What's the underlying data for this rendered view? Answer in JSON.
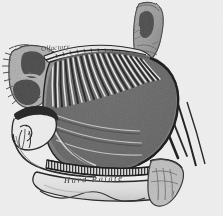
{
  "figure": {
    "kind": "anatomical-engraving",
    "background_color": "#ffffff",
    "ink_color": "#1c1c1c"
  },
  "labels": {
    "olfactory": "Olfactory",
    "hard_palate": "Hard Palate"
  },
  "structures": {
    "sinus_cavities": 2,
    "olfactory_fiber_count": 26,
    "cribriform_plate": "cribriform plate",
    "nasal_septum": "nasal septum",
    "soft_palate": "soft palate",
    "nostril": "nostril"
  },
  "palette": {
    "ink": "#1c1c1c",
    "deep_shadow": "#141414",
    "mid_tone": "#8d8d8d",
    "light_tone": "#c9c9c9",
    "highlight": "#fdfdfd",
    "paper": "#ffffff"
  }
}
